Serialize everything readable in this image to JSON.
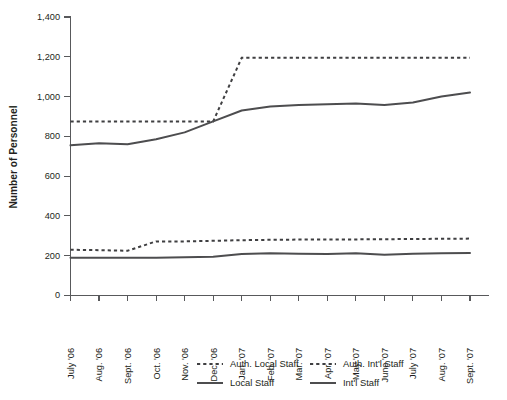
{
  "chart_data": {
    "type": "line",
    "title": "",
    "xlabel": "",
    "ylabel": "Number of Personnel",
    "ylim": [
      0,
      1400
    ],
    "ytick_step": 200,
    "grid": false,
    "legend_position": "bottom",
    "categories": [
      "July '06",
      "Aug. '06",
      "Sept. '06",
      "Oct. '06",
      "Nov. '06",
      "Dec. '06",
      "Jan. '07",
      "Feb. '07",
      "Mar. '07",
      "Apr. '07",
      "May '07",
      "June '07",
      "July '07",
      "Aug. '07",
      "Sept. '07"
    ],
    "ytick_labels": [
      "0",
      "200",
      "400",
      "600",
      "800",
      "1,000",
      "1,200",
      "1,400"
    ],
    "ytick_values": [
      0,
      200,
      400,
      600,
      800,
      1000,
      1200,
      1400
    ],
    "series": [
      {
        "name": "Auth. Local Staff",
        "style": "dashed",
        "color": "#3f3f41",
        "values": [
          875,
          875,
          875,
          875,
          875,
          875,
          1195,
          1195,
          1195,
          1195,
          1195,
          1195,
          1195,
          1195,
          1195
        ]
      },
      {
        "name": "Auth. Int'l  Staff",
        "style": "dashed",
        "color": "#3f3f41",
        "values": [
          230,
          228,
          225,
          272,
          272,
          275,
          278,
          280,
          281,
          282,
          282,
          283,
          284,
          285,
          286
        ]
      },
      {
        "name": "Local Staff",
        "style": "solid",
        "color": "#4d4d4f",
        "values": [
          755,
          765,
          760,
          785,
          820,
          875,
          930,
          950,
          958,
          962,
          965,
          958,
          970,
          1000,
          1020
        ]
      },
      {
        "name": "Int'l Staff",
        "style": "solid",
        "color": "#4d4d4f",
        "values": [
          190,
          190,
          190,
          190,
          192,
          195,
          208,
          212,
          210,
          208,
          212,
          205,
          210,
          212,
          214
        ]
      }
    ]
  },
  "legend": {
    "entries": [
      {
        "label": "Auth. Local Staff",
        "style": "dashed"
      },
      {
        "label": "Auth. Int'l  Staff",
        "style": "dashed"
      },
      {
        "label": "Local Staff",
        "style": "solid"
      },
      {
        "label": "Int'l Staff",
        "style": "solid"
      }
    ]
  },
  "colors": {
    "axis": "#58595b",
    "solid_series": "#4d4d4f",
    "dashed_series": "#3f3f41",
    "text": "#231f20",
    "background": "#ffffff"
  }
}
